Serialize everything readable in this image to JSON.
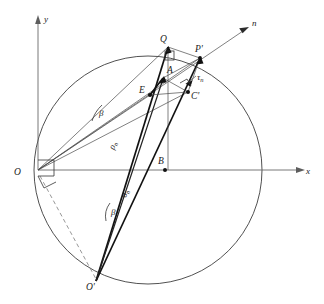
{
  "figure": {
    "type": "geometric-stress-diagram",
    "title": "",
    "canvas": {
      "width": 324,
      "height": 304,
      "background": "#ffffff"
    },
    "colors": {
      "ink": "#1a1a1a",
      "construction_line": "#4a4a4a",
      "circle": "#3d3d3d",
      "axis": "#6a6a6a",
      "bold_vector": "#111111",
      "dashed": "#7c7c7c"
    },
    "axes": [
      {
        "name": "y-axis",
        "label": "y",
        "direction": "up",
        "origin": [
          38,
          170
        ],
        "tip": [
          38,
          18
        ]
      },
      {
        "name": "x-axis",
        "label": "x",
        "direction": "right",
        "origin": [
          38,
          170
        ],
        "tip": [
          305,
          170
        ]
      },
      {
        "name": "n-axis",
        "label": "n",
        "direction": "up-right",
        "origin": [
          38,
          170
        ],
        "tip": [
          248,
          28
        ]
      }
    ],
    "circle": {
      "center": [
        148,
        170
      ],
      "radius": 114,
      "stroke": "#3d3d3d"
    },
    "points": [
      {
        "id": "O",
        "label": "O",
        "at": [
          38,
          170
        ],
        "label_at": [
          16,
          174
        ]
      },
      {
        "id": "Q",
        "label": "Q",
        "at": [
          168,
          47
        ],
        "label_at": [
          162,
          42
        ]
      },
      {
        "id": "Pp",
        "label": "P'",
        "at": [
          200,
          58
        ],
        "label_at": [
          196,
          52
        ]
      },
      {
        "id": "A",
        "label": "A",
        "at": [
          163,
          78
        ],
        "label_at": [
          167,
          72
        ]
      },
      {
        "id": "E",
        "label": "E",
        "at": [
          150,
          95
        ],
        "label_at": [
          142,
          92
        ]
      },
      {
        "id": "Cp",
        "label": "C'",
        "at": [
          188,
          92
        ],
        "label_at": [
          192,
          96
        ]
      },
      {
        "id": "B",
        "label": "B",
        "at": [
          165,
          170
        ],
        "label_at": [
          159,
          163
        ]
      },
      {
        "id": "Op",
        "label": "O'",
        "at": [
          96,
          281
        ],
        "label_at": [
          88,
          288
        ]
      }
    ],
    "vector_labels": [
      {
        "id": "rho-n",
        "text": "ρ",
        "sub": "n",
        "at": [
          119,
          148
        ]
      },
      {
        "id": "sigma-n",
        "text": "σ",
        "sub": "n",
        "at": [
          131,
          196
        ]
      },
      {
        "id": "tau-n",
        "text": "τ",
        "sub": "n",
        "at": [
          199,
          79
        ]
      }
    ],
    "angle_labels": [
      {
        "id": "beta-upper",
        "text": "β",
        "at": [
          101,
          112
        ]
      },
      {
        "id": "beta-lower",
        "text": "β",
        "at": [
          113,
          211
        ]
      }
    ],
    "markers": [
      {
        "id": "right-angle-at-origin",
        "type": "right-angle-square",
        "at": [
          38,
          170
        ]
      },
      {
        "id": "right-angle-at-Q",
        "type": "right-angle-square",
        "at": [
          168,
          47
        ]
      },
      {
        "id": "right-angle-at-Cp",
        "type": "right-angle-square",
        "at": [
          188,
          92
        ]
      }
    ],
    "segments": [
      {
        "id": "chord-O-Q",
        "from": "O",
        "to": "Q",
        "weight": "thin"
      },
      {
        "id": "chord-O-Pp",
        "from": "O",
        "to": "P'",
        "weight": "thin"
      },
      {
        "id": "chord-O-Cp",
        "from": "O",
        "to": "C'",
        "weight": "thin"
      },
      {
        "id": "chord-O-E",
        "from": "O",
        "to": "E",
        "weight": "thin"
      },
      {
        "id": "ray-Op-Q",
        "from": "O'",
        "to": "Q",
        "weight": "bold"
      },
      {
        "id": "ray-Op-Pp",
        "from": "O'",
        "to": "P'",
        "weight": "bold"
      },
      {
        "id": "ray-Op-A",
        "from": "O'",
        "to": "A",
        "weight": "bold"
      },
      {
        "id": "vertical-Q-drop",
        "from": "Q",
        "to": "B",
        "weight": "thin"
      },
      {
        "id": "seg-E-A",
        "from": "E",
        "to": "A",
        "weight": "bold"
      },
      {
        "id": "seg-E-Cp",
        "from": "E",
        "to": "C'",
        "weight": "thin"
      },
      {
        "id": "seg-A-Cp",
        "from": "A",
        "to": "C'",
        "weight": "thin"
      },
      {
        "id": "seg-Q-Pp",
        "from": "Q",
        "to": "P'",
        "weight": "thin"
      },
      {
        "id": "seg-Pp-Cp",
        "from": "P'",
        "to": "C'",
        "weight": "thin"
      },
      {
        "id": "dashed-O-lower",
        "from": "O",
        "to": "O'",
        "weight": "dashed"
      }
    ]
  }
}
